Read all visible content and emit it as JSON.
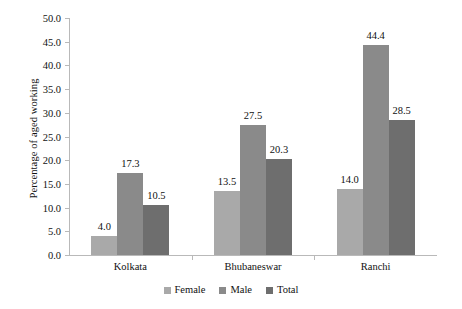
{
  "chart_data": {
    "type": "bar",
    "title": "",
    "xlabel": "",
    "ylabel": "Percentage of aged working",
    "categories": [
      "Kolkata",
      "Bhubaneswar",
      "Ranchi"
    ],
    "series": [
      {
        "name": "Female",
        "values": [
          4.0,
          13.5,
          14.0
        ],
        "color": "#a9a9a9"
      },
      {
        "name": "Male",
        "values": [
          17.3,
          27.5,
          44.4
        ],
        "color": "#8a8a8a"
      },
      {
        "name": "Total",
        "values": [
          10.5,
          20.3,
          28.5
        ],
        "color": "#6e6e6e"
      }
    ],
    "data_labels": [
      "4.0",
      "17.3",
      "10.5",
      "13.5",
      "27.5",
      "20.3",
      "14.0",
      "44.4",
      "28.5"
    ],
    "ylim": [
      0.0,
      50.0
    ],
    "ytick_labels": [
      "0.0",
      "5.0",
      "10.0",
      "15.0",
      "20.0",
      "25.0",
      "30.0",
      "35.0",
      "40.0",
      "45.0",
      "50.0"
    ],
    "ytick_values": [
      0,
      5,
      10,
      15,
      20,
      25,
      30,
      35,
      40,
      45,
      50
    ],
    "grid": false,
    "legend_position": "bottom"
  },
  "colors": {
    "female": "#a9a9a9",
    "male": "#8a8a8a",
    "total": "#6e6e6e",
    "axis": "#b9b9b9",
    "text": "#111111",
    "background": "#ffffff"
  }
}
